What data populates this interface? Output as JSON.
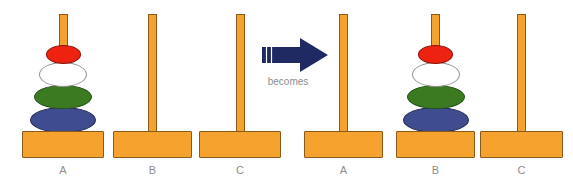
{
  "diagram": {
    "transition": {
      "label": "becomes",
      "arrow_icon": "right-arrow-icon",
      "arrow_color": "#1f2a63",
      "direction": "right"
    },
    "colors": {
      "peg": "#f5a22e",
      "peg_outline": "#8a5a1c",
      "disk_blue": "#3f4c8f",
      "disk_green": "#3c7a22",
      "disk_white": "#ffffff",
      "disk_red": "#ee2211",
      "label_text": "#8d8d8d",
      "background": "#ffffff"
    },
    "states": [
      {
        "name": "before",
        "pegs": [
          {
            "label": "A",
            "x": 22,
            "base_width": 82,
            "disks": [
              "blue",
              "green",
              "white",
              "red"
            ]
          },
          {
            "label": "B",
            "x": 113,
            "base_width": 79,
            "disks": []
          },
          {
            "label": "C",
            "x": 199,
            "base_width": 82,
            "disks": []
          }
        ]
      },
      {
        "name": "after",
        "pegs": [
          {
            "label": "A",
            "x": 304,
            "base_width": 79,
            "disks": []
          },
          {
            "label": "B",
            "x": 396,
            "base_width": 79,
            "disks": [
              "blue",
              "green",
              "white",
              "red"
            ]
          },
          {
            "label": "C",
            "x": 480,
            "base_width": 83,
            "disks": []
          }
        ]
      }
    ],
    "disk_sizes": {
      "blue": {
        "width": 66,
        "height": 26
      },
      "green": {
        "width": 58,
        "height": 24
      },
      "white": {
        "width": 48,
        "height": 25
      },
      "red": {
        "width": 35,
        "height": 19
      }
    }
  }
}
